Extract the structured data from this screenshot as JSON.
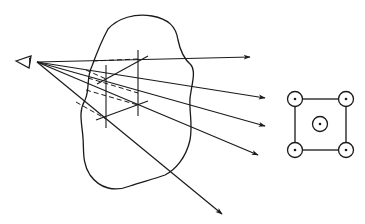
{
  "diagram": {
    "colors": {
      "stroke": "#1a1a1a",
      "background": "#ffffff"
    },
    "eye": {
      "apex": [
        37,
        62
      ],
      "back_top": [
        31,
        56
      ],
      "back_bottom": [
        29,
        68
      ],
      "tip": [
        16,
        61
      ]
    },
    "rays": [
      {
        "end": [
          250,
          57
        ]
      },
      {
        "end": [
          265,
          98
        ]
      },
      {
        "end": [
          265,
          126
        ]
      },
      {
        "end": [
          258,
          155
        ]
      },
      {
        "end": [
          222,
          214
        ]
      }
    ],
    "dashed_segments": [
      {
        "from": [
          93,
          61
        ],
        "to": [
          138,
          59
        ]
      },
      {
        "from": [
          86,
          70
        ],
        "to": [
          106,
          79
        ]
      },
      {
        "from": [
          88,
          77
        ],
        "to": [
          138,
          93
        ]
      },
      {
        "from": [
          86,
          90
        ],
        "to": [
          138,
          105
        ]
      },
      {
        "from": [
          76,
          102
        ],
        "to": [
          106,
          119
        ]
      }
    ],
    "verticals": [
      {
        "x": 106,
        "y1": 65,
        "y2": 128
      },
      {
        "x": 138,
        "y1": 50,
        "y2": 116
      }
    ],
    "diagonals": [
      {
        "from": [
          99,
          83
        ],
        "to": [
          148,
          56
        ]
      },
      {
        "from": [
          96,
          120
        ],
        "to": [
          148,
          101
        ]
      }
    ],
    "pattern": {
      "square": {
        "x": 295,
        "y": 99,
        "w": 51,
        "h": 51
      },
      "points": [
        [
          295,
          99
        ],
        [
          346,
          99
        ],
        [
          320,
          124
        ],
        [
          295,
          150
        ],
        [
          346,
          150
        ]
      ],
      "radius": 7.5
    }
  }
}
